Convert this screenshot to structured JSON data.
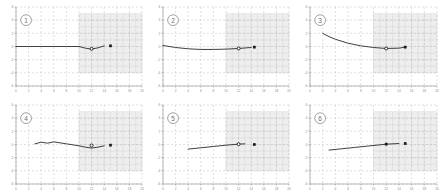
{
  "figure": {
    "title": "",
    "panel_count": 6,
    "rows": 2,
    "cols": 3,
    "background_color": "#ffffff",
    "line_color": "#2b2b2b",
    "grid_color": "#b9b9b9",
    "axis_color": "#8d8d8d",
    "shade_color": "#d9d9d9",
    "marker_fill": "#1a1a1a"
  },
  "axes": {
    "xlabel": "",
    "ylabel": "",
    "xlim": [
      0,
      20
    ],
    "ylim": [
      -6,
      6
    ],
    "x_ticks": [
      0,
      2,
      4,
      6,
      8,
      10,
      12,
      14,
      16,
      18,
      20
    ],
    "x_tick_labels": [
      "0",
      "2",
      "4",
      "6",
      "8",
      "10",
      "12",
      "14",
      "16",
      "18",
      "20"
    ],
    "y_ticks": [
      -6,
      -4,
      -2,
      0,
      2,
      4,
      6
    ],
    "y_tick_labels": [
      "-6",
      "-4",
      "-2",
      "0",
      "2",
      "4",
      "6"
    ],
    "grid": true,
    "grid_style": "dashed",
    "shaded_region": {
      "x_start": 10,
      "x_end": 20,
      "y_start": -4,
      "y_end": 5,
      "label": ""
    }
  },
  "chart_data": {
    "type": "line",
    "title": "",
    "xlabel": "",
    "ylabel": "",
    "xlim": [
      0,
      20
    ],
    "ylim": [
      -6,
      6
    ],
    "grid": true,
    "legend": "none",
    "panels": [
      {
        "id": "1",
        "label": "1",
        "x": [
          0,
          2,
          4,
          6,
          8,
          10,
          11,
          12,
          13,
          14
        ],
        "y": [
          0,
          0,
          0,
          0,
          0,
          0,
          -0.25,
          -0.4,
          -0.2,
          0.1
        ],
        "markers": [
          {
            "x": 12,
            "y": -0.35,
            "style": "circle-open"
          },
          {
            "x": 15,
            "y": 0.1,
            "style": "square-filled"
          }
        ]
      },
      {
        "id": "2",
        "label": "2",
        "x": [
          0,
          2,
          4,
          6,
          8,
          10,
          12,
          14
        ],
        "y": [
          0.15,
          -0.15,
          -0.35,
          -0.45,
          -0.45,
          -0.4,
          -0.3,
          -0.15
        ],
        "markers": [
          {
            "x": 12,
            "y": -0.3,
            "style": "circle-open"
          },
          {
            "x": 14.5,
            "y": -0.1,
            "style": "square-filled"
          }
        ]
      },
      {
        "id": "3",
        "label": "3",
        "x": [
          2,
          3,
          4,
          6,
          8,
          10,
          12,
          14,
          15
        ],
        "y": [
          2.0,
          1.5,
          1.1,
          0.5,
          0.1,
          -0.15,
          -0.3,
          -0.25,
          -0.1
        ],
        "markers": [
          {
            "x": 12,
            "y": -0.3,
            "style": "circle-open"
          },
          {
            "x": 15,
            "y": -0.1,
            "style": "square-filled"
          }
        ]
      },
      {
        "id": "4",
        "label": "4",
        "x": [
          3,
          4,
          5,
          6,
          7,
          8,
          10,
          11,
          12,
          13,
          14
        ],
        "y": [
          0.1,
          0.35,
          0.2,
          0.4,
          0.25,
          0.1,
          -0.2,
          -0.4,
          -0.55,
          -0.4,
          -0.2
        ],
        "markers": [
          {
            "x": 12,
            "y": -0.15,
            "style": "circle-open"
          },
          {
            "x": 15,
            "y": -0.1,
            "style": "square-filled"
          }
        ]
      },
      {
        "id": "5",
        "label": "5",
        "x": [
          4,
          6,
          8,
          10,
          12,
          13
        ],
        "y": [
          -0.7,
          -0.5,
          -0.3,
          -0.1,
          0.05,
          0.1
        ],
        "markers": [
          {
            "x": 12,
            "y": 0.05,
            "style": "circle-open"
          },
          {
            "x": 14.5,
            "y": 0.0,
            "style": "square-filled"
          }
        ]
      },
      {
        "id": "6",
        "label": "6",
        "x": [
          3,
          5,
          7,
          9,
          11,
          12,
          14
        ],
        "y": [
          -0.85,
          -0.65,
          -0.45,
          -0.25,
          -0.05,
          0.05,
          0.15
        ],
        "markers": [
          {
            "x": 12,
            "y": 0.05,
            "style": "square-filled"
          },
          {
            "x": 15,
            "y": 0.15,
            "style": "square-filled"
          }
        ]
      }
    ]
  }
}
